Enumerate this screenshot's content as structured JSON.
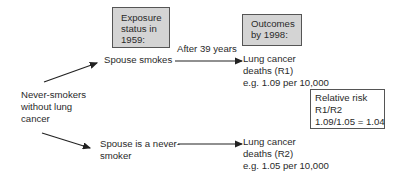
{
  "headers": {
    "exposure": [
      "Exposure",
      "status in",
      "1959:"
    ],
    "outcomes": [
      "Outcomes",
      "by 1998:"
    ]
  },
  "start": [
    "Never-smokers",
    "without lung",
    "cancer"
  ],
  "arrow_label": "After 39 years",
  "exposed": {
    "label": "Spouse smokes",
    "outcome": [
      "Lung cancer",
      "deaths (R1)",
      "e.g. 1.09 per 10,000"
    ]
  },
  "unexposed": {
    "label": [
      "Spouse is a never-",
      "smoker"
    ],
    "outcome": [
      "Lung cancer",
      "deaths (R2)",
      "e.g. 1.05 per 10,000"
    ]
  },
  "relative_risk": [
    "Relative risk",
    "R1/R2",
    "1.09/1.05 = 1.04"
  ],
  "colors": {
    "box_fill": "#d4d4d4",
    "line": "#222222",
    "text": "#2a2a2a"
  }
}
